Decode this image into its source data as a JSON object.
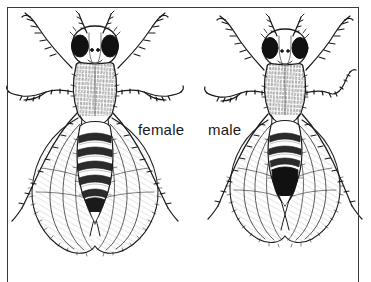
{
  "figure": {
    "kind": "scientific-line-illustration",
    "background_color": "#ffffff",
    "ink_color": "#1a1a1a",
    "frame": {
      "visible": true,
      "color": "#3a3a3a",
      "thickness_px": 1.5,
      "open_edge": "bottom"
    }
  },
  "labels": {
    "female": "female",
    "male": "male"
  },
  "specimens": [
    {
      "id": "female",
      "label": "female",
      "side": "left",
      "eye_color": "#111111",
      "abdomen": {
        "shape": "pointed",
        "band_count": 6,
        "tip": "tapered-light"
      }
    },
    {
      "id": "male",
      "label": "male",
      "side": "right",
      "eye_color": "#111111",
      "abdomen": {
        "shape": "rounded",
        "band_count": 4,
        "tip": "solid-black"
      }
    }
  ]
}
